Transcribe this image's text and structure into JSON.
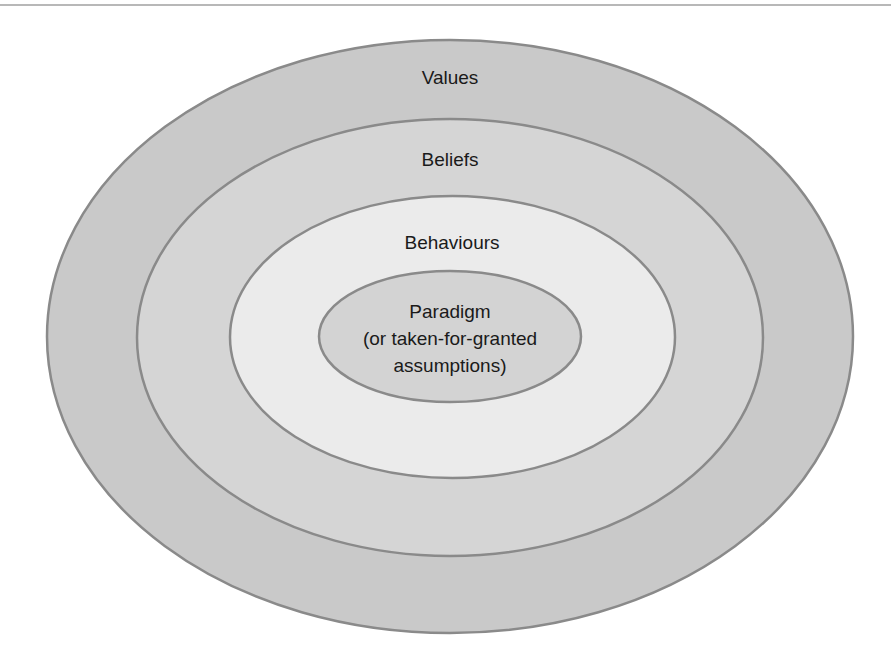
{
  "diagram": {
    "type": "nested-ellipses",
    "layers": [
      {
        "label": "Values",
        "fill": "#c9c9c9",
        "stroke": "#8a8a8a",
        "cx": 450,
        "cy": 336.5,
        "rx": 403,
        "ry": 296.5,
        "label_y": 78
      },
      {
        "label": "Beliefs",
        "fill": "#d5d5d5",
        "stroke": "#8a8a8a",
        "cx": 450,
        "cy": 337.5,
        "rx": 313,
        "ry": 218.5,
        "label_y": 160
      },
      {
        "label": "Behaviours",
        "fill": "#ebebeb",
        "stroke": "#8a8a8a",
        "cx": 452.5,
        "cy": 337,
        "rx": 222.5,
        "ry": 141,
        "label_y": 243
      },
      {
        "label_lines": [
          "Paradigm",
          "(or taken-for-granted",
          "assumptions)"
        ],
        "fill": "#d3d3d3",
        "stroke": "#8a8a8a",
        "cx": 450,
        "cy": 336.5,
        "rx": 131,
        "ry": 65.5,
        "label_y": 312
      }
    ]
  },
  "text": {
    "values": "Values",
    "beliefs": "Beliefs",
    "behaviours": "Behaviours",
    "paradigm_line1": "Paradigm",
    "paradigm_line2": "(or taken-for-granted",
    "paradigm_line3": "assumptions)"
  }
}
